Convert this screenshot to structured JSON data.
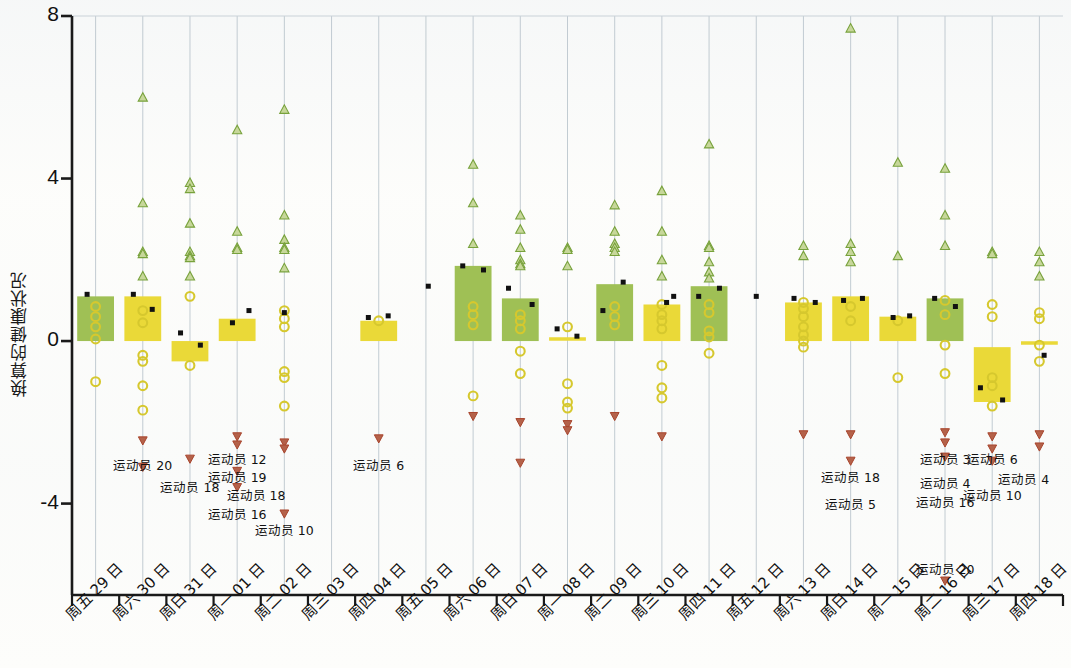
{
  "chart_data": {
    "type": "bar",
    "title": "",
    "subtitle": "",
    "xlabel": "",
    "ylabel": "换算的健康状况",
    "ylim": [
      -6.2,
      8
    ],
    "yticks": [
      8,
      4,
      0,
      -4
    ],
    "ytick_labels": [
      "8",
      "4",
      "0",
      "-4"
    ],
    "grid": true,
    "grid_orientation": "vertical",
    "legend_position": "none",
    "categories": [
      "周五 29 日",
      "周六 30 日",
      "周日 31 日",
      "周一 01 日",
      "周二 02 日",
      "周三 03 日",
      "周四 04 日",
      "周五 05 日",
      "周六 06 日",
      "周日 07 日",
      "周一 08 日",
      "周二 09 日",
      "周三 10 日",
      "周四 11 日",
      "周五 12 日",
      "周六 13 日",
      "周日 14 日",
      "周一 15 日",
      "周二 16 日",
      "周三 17 日",
      "周四 18 日"
    ],
    "bar_colors": {
      "positive_high": "#9fc055",
      "positive_low": "#ead938",
      "flat": "#ead938"
    },
    "series": [
      {
        "name": "bar",
        "description": "区间条（每日健康状况范围）",
        "values": [
          {
            "cat": "周五 29 日",
            "low": 0.0,
            "high": 1.1,
            "color": "#9fc055"
          },
          {
            "cat": "周六 30 日",
            "low": 0.0,
            "high": 1.1,
            "color": "#ead938"
          },
          {
            "cat": "周日 31 日",
            "low": -0.5,
            "high": 0.0,
            "color": "#ead938"
          },
          {
            "cat": "周一 01 日",
            "low": 0.0,
            "high": 0.55,
            "color": "#ead938"
          },
          {
            "cat": "周二 02 日",
            "low": null,
            "high": null,
            "color": "none"
          },
          {
            "cat": "周三 03 日",
            "low": null,
            "high": null,
            "color": "none"
          },
          {
            "cat": "周四 04 日",
            "low": 0.0,
            "high": 0.5,
            "color": "#ead938"
          },
          {
            "cat": "周五 05 日",
            "low": null,
            "high": null,
            "color": "none"
          },
          {
            "cat": "周六 06 日",
            "low": 0.0,
            "high": 1.85,
            "color": "#9fc055"
          },
          {
            "cat": "周日 07 日",
            "low": 0.0,
            "high": 1.05,
            "color": "#9fc055"
          },
          {
            "cat": "周一 08 日",
            "low": 0.05,
            "high": 0.05,
            "color": "#ead938"
          },
          {
            "cat": "周二 09 日",
            "low": 0.0,
            "high": 1.4,
            "color": "#9fc055"
          },
          {
            "cat": "周三 10 日",
            "low": 0.0,
            "high": 0.9,
            "color": "#ead938"
          },
          {
            "cat": "周四 11 日",
            "low": 0.0,
            "high": 1.35,
            "color": "#9fc055"
          },
          {
            "cat": "周五 12 日",
            "low": null,
            "high": null,
            "color": "none"
          },
          {
            "cat": "周六 13 日",
            "low": 0.0,
            "high": 0.95,
            "color": "#ead938"
          },
          {
            "cat": "周日 14 日",
            "low": 0.0,
            "high": 1.1,
            "color": "#ead938"
          },
          {
            "cat": "周一 15 日",
            "low": 0.0,
            "high": 0.6,
            "color": "#ead938"
          },
          {
            "cat": "周二 16 日",
            "low": 0.0,
            "high": 1.05,
            "color": "#9fc055"
          },
          {
            "cat": "周三 17 日",
            "low": -1.5,
            "high": -0.15,
            "color": "#ead938"
          },
          {
            "cat": "周四 18 日",
            "low": -0.05,
            "high": -0.05,
            "color": "#ead938"
          }
        ]
      },
      {
        "name": "mean-marker",
        "marker": "black-square",
        "points": [
          {
            "cat": "周五 29 日",
            "x_off": -0.18,
            "y": 1.15
          },
          {
            "cat": "周六 30 日",
            "x_off": -0.2,
            "y": 1.15
          },
          {
            "cat": "周六 30 日",
            "x_off": 0.2,
            "y": 0.78
          },
          {
            "cat": "周日 31 日",
            "x_off": -0.2,
            "y": 0.2
          },
          {
            "cat": "周日 31 日",
            "x_off": 0.22,
            "y": -0.1
          },
          {
            "cat": "周一 01 日",
            "x_off": -0.1,
            "y": 0.45
          },
          {
            "cat": "周一 01 日",
            "x_off": 0.25,
            "y": 0.75
          },
          {
            "cat": "周二 02 日",
            "x_off": 0.0,
            "y": 0.7
          },
          {
            "cat": "周四 04 日",
            "x_off": -0.22,
            "y": 0.58
          },
          {
            "cat": "周四 04 日",
            "x_off": 0.2,
            "y": 0.62
          },
          {
            "cat": "周五 05 日",
            "x_off": 0.05,
            "y": 1.35
          },
          {
            "cat": "周六 06 日",
            "x_off": -0.22,
            "y": 1.85
          },
          {
            "cat": "周六 06 日",
            "x_off": 0.22,
            "y": 1.75
          },
          {
            "cat": "周日 07 日",
            "x_off": -0.25,
            "y": 1.3
          },
          {
            "cat": "周日 07 日",
            "x_off": 0.25,
            "y": 0.9
          },
          {
            "cat": "周一 08 日",
            "x_off": -0.22,
            "y": 0.3
          },
          {
            "cat": "周一 08 日",
            "x_off": 0.2,
            "y": 0.12
          },
          {
            "cat": "周二 09 日",
            "x_off": -0.25,
            "y": 0.75
          },
          {
            "cat": "周二 09 日",
            "x_off": 0.18,
            "y": 1.45
          },
          {
            "cat": "周三 10 日",
            "x_off": 0.25,
            "y": 1.1
          },
          {
            "cat": "周三 10 日",
            "x_off": 0.1,
            "y": 0.95
          },
          {
            "cat": "周四 11 日",
            "x_off": -0.22,
            "y": 1.1
          },
          {
            "cat": "周四 11 日",
            "x_off": 0.22,
            "y": 1.3
          },
          {
            "cat": "周五 12 日",
            "x_off": 0.0,
            "y": 1.1
          },
          {
            "cat": "周六 13 日",
            "x_off": -0.2,
            "y": 1.05
          },
          {
            "cat": "周六 13 日",
            "x_off": 0.25,
            "y": 0.95
          },
          {
            "cat": "周日 14 日",
            "x_off": -0.15,
            "y": 1.0
          },
          {
            "cat": "周日 14 日",
            "x_off": 0.25,
            "y": 1.05
          },
          {
            "cat": "周一 15 日",
            "x_off": -0.1,
            "y": 0.58
          },
          {
            "cat": "周一 15 日",
            "x_off": 0.25,
            "y": 0.62
          },
          {
            "cat": "周二 16 日",
            "x_off": -0.22,
            "y": 1.05
          },
          {
            "cat": "周二 16 日",
            "x_off": 0.22,
            "y": 0.85
          },
          {
            "cat": "周三 17 日",
            "x_off": -0.25,
            "y": -1.15
          },
          {
            "cat": "周三 17 日",
            "x_off": 0.22,
            "y": -1.45
          },
          {
            "cat": "周四 18 日",
            "x_off": 0.1,
            "y": -0.35
          }
        ]
      },
      {
        "name": "upper-outliers",
        "marker": "green-triangle-up",
        "points": [
          {
            "cat": "周六 30 日",
            "values": [
              6.0,
              3.4,
              2.2,
              2.15,
              1.6
            ]
          },
          {
            "cat": "周日 31 日",
            "values": [
              3.9,
              3.75,
              2.9,
              2.2,
              2.1,
              2.05,
              1.6
            ]
          },
          {
            "cat": "周一 01 日",
            "values": [
              5.2,
              2.7,
              2.3,
              2.25
            ]
          },
          {
            "cat": "周二 02 日",
            "values": [
              5.7,
              3.1,
              2.5,
              2.3,
              2.25,
              1.8
            ]
          },
          {
            "cat": "周四 04 日",
            "values": []
          },
          {
            "cat": "周六 06 日",
            "values": [
              4.35,
              3.4,
              2.4
            ]
          },
          {
            "cat": "周日 07 日",
            "values": [
              3.1,
              2.75,
              2.3,
              2.0,
              1.9,
              1.85
            ]
          },
          {
            "cat": "周一 08 日",
            "values": [
              2.3,
              2.25,
              1.85
            ]
          },
          {
            "cat": "周二 09 日",
            "values": [
              3.35,
              2.7,
              2.4,
              2.3,
              2.2
            ]
          },
          {
            "cat": "周三 10 日",
            "values": [
              3.7,
              2.7,
              2.0,
              1.6
            ]
          },
          {
            "cat": "周四 11 日",
            "values": [
              4.85,
              2.35,
              2.3,
              1.95,
              1.7,
              1.55
            ]
          },
          {
            "cat": "周六 13 日",
            "values": [
              2.35,
              2.1
            ]
          },
          {
            "cat": "周日 14 日",
            "values": [
              7.7,
              2.4,
              2.2,
              1.95
            ]
          },
          {
            "cat": "周一 15 日",
            "values": [
              4.4,
              2.1
            ]
          },
          {
            "cat": "周二 16 日",
            "values": [
              4.25,
              3.1,
              2.35
            ]
          },
          {
            "cat": "周三 17 日",
            "values": [
              2.2,
              2.15
            ]
          },
          {
            "cat": "周四 18 日",
            "values": [
              2.2,
              1.95,
              1.6
            ]
          }
        ]
      },
      {
        "name": "mid-values",
        "marker": "yellow-circle",
        "points": [
          {
            "cat": "周五 29 日",
            "values": [
              0.85,
              0.6,
              0.35,
              0.05,
              -1.0
            ]
          },
          {
            "cat": "周六 30 日",
            "values": [
              0.75,
              0.45,
              -0.35,
              -0.5,
              -1.1,
              -1.7
            ]
          },
          {
            "cat": "周日 31 日",
            "values": [
              1.1,
              -0.6
            ]
          },
          {
            "cat": "周二 02 日",
            "values": [
              0.75,
              0.55,
              0.35,
              -0.75,
              -0.9,
              -1.6
            ]
          },
          {
            "cat": "周四 04 日",
            "values": [
              0.5
            ]
          },
          {
            "cat": "周六 06 日",
            "values": [
              0.85,
              0.65,
              0.4,
              -1.35
            ]
          },
          {
            "cat": "周日 07 日",
            "values": [
              0.65,
              0.5,
              0.3,
              -0.25,
              -0.8
            ]
          },
          {
            "cat": "周一 08 日",
            "values": [
              0.35,
              -1.05,
              -1.5,
              -1.65
            ]
          },
          {
            "cat": "周二 09 日",
            "values": [
              0.85,
              0.6,
              0.4
            ]
          },
          {
            "cat": "周三 10 日",
            "values": [
              0.9,
              0.65,
              0.5,
              0.3,
              -0.6,
              -1.15,
              -1.4
            ]
          },
          {
            "cat": "周四 11 日",
            "values": [
              0.9,
              0.7,
              0.25,
              0.1,
              -0.3
            ]
          },
          {
            "cat": "周六 13 日",
            "values": [
              0.95,
              0.8,
              0.6,
              0.35,
              0.15,
              0.0,
              -0.15
            ]
          },
          {
            "cat": "周日 14 日",
            "values": [
              0.85,
              0.5
            ]
          },
          {
            "cat": "周一 15 日",
            "values": [
              0.5,
              -0.9
            ]
          },
          {
            "cat": "周二 16 日",
            "values": [
              1.0,
              0.65,
              -0.1,
              -0.8
            ]
          },
          {
            "cat": "周三 17 日",
            "values": [
              0.9,
              0.6,
              -0.9,
              -1.1,
              -1.6
            ]
          },
          {
            "cat": "周四 18 日",
            "values": [
              0.7,
              0.55,
              -0.1,
              -0.5
            ]
          }
        ]
      },
      {
        "name": "lower-outliers",
        "marker": "red-triangle-down",
        "points": [
          {
            "cat": "周六 30 日",
            "values": [
              -2.45,
              -3.1
            ]
          },
          {
            "cat": "周日 31 日",
            "values": [
              -2.9
            ]
          },
          {
            "cat": "周一 01 日",
            "values": [
              -2.35,
              -2.55,
              -3.2,
              -3.6
            ]
          },
          {
            "cat": "周二 02 日",
            "values": [
              -2.5,
              -2.65,
              -4.25
            ]
          },
          {
            "cat": "周四 04 日",
            "values": [
              -2.4
            ]
          },
          {
            "cat": "周六 06 日",
            "values": [
              -1.85
            ]
          },
          {
            "cat": "周日 07 日",
            "values": [
              -2.0,
              -3.0
            ]
          },
          {
            "cat": "周一 08 日",
            "values": [
              -2.05,
              -2.2
            ]
          },
          {
            "cat": "周二 09 日",
            "values": [
              -1.85
            ]
          },
          {
            "cat": "周三 10 日",
            "values": [
              -2.35
            ]
          },
          {
            "cat": "周六 13 日",
            "values": [
              -2.3
            ]
          },
          {
            "cat": "周日 14 日",
            "values": [
              -2.3,
              -2.95
            ]
          },
          {
            "cat": "周二 16 日",
            "values": [
              -2.25,
              -2.5,
              -2.85,
              -5.9
            ]
          },
          {
            "cat": "周三 17 日",
            "values": [
              -2.35,
              -2.65,
              -2.95
            ]
          },
          {
            "cat": "周四 18 日",
            "values": [
              -2.3,
              -2.6
            ]
          }
        ]
      }
    ],
    "annotations": [
      {
        "text": "运动员 20",
        "cat": "周六 30 日",
        "y": -3.0,
        "align": "center"
      },
      {
        "text": "运动员 18",
        "cat": "周日 31 日",
        "y": -3.55,
        "align": "center"
      },
      {
        "text": "运动员 12",
        "cat": "周一 01 日",
        "y": -2.85,
        "align": "center"
      },
      {
        "text": "运动员 19",
        "cat": "周一 01 日",
        "y": -3.3,
        "align": "center"
      },
      {
        "text": "运动员 18",
        "cat": "周一 01 日",
        "y": -3.75,
        "align": "right"
      },
      {
        "text": "运动员 16",
        "cat": "周一 01 日",
        "y": -4.2,
        "align": "center"
      },
      {
        "text": "运动员 10",
        "cat": "周二 02 日",
        "y": -4.6,
        "align": "center"
      },
      {
        "text": "运动员 6",
        "cat": "周四 04 日",
        "y": -3.0,
        "align": "center"
      },
      {
        "text": "运动员 18",
        "cat": "周日 14 日",
        "y": -3.3,
        "align": "center"
      },
      {
        "text": "运动员 5",
        "cat": "周日 14 日",
        "y": -3.95,
        "align": "center"
      },
      {
        "text": "运动员 3",
        "cat": "周二 16 日",
        "y": -2.85,
        "align": "center"
      },
      {
        "text": "运动员 4",
        "cat": "周二 16 日",
        "y": -3.45,
        "align": "center"
      },
      {
        "text": "运动员 16",
        "cat": "周二 16 日",
        "y": -3.9,
        "align": "center"
      },
      {
        "text": "运动员 20",
        "cat": "周二 16 日",
        "y": -5.55,
        "align": "center"
      },
      {
        "text": "运动员 6",
        "cat": "周三 17 日",
        "y": -2.85,
        "align": "center"
      },
      {
        "text": "运动员 4",
        "cat": "周三 17 日",
        "y": -3.35,
        "align": "right-edge"
      },
      {
        "text": "运动员 10",
        "cat": "周三 17 日",
        "y": -3.75,
        "align": "center"
      }
    ]
  },
  "axes": {
    "y_title": "换算的健康状况",
    "y_tick_labels": [
      "8",
      "4",
      "0",
      "-4"
    ],
    "x_tick_labels": [
      "周五 29 日",
      "周六 30 日",
      "周日 31 日",
      "周一 01 日",
      "周二 02 日",
      "周三 03 日",
      "周四 04 日",
      "周五 05 日",
      "周六 06 日",
      "周日 07 日",
      "周一 08 日",
      "周二 09 日",
      "周三 10 日",
      "周四 11 日",
      "周五 12 日",
      "周六 13 日",
      "周日 14 日",
      "周一 15 日",
      "周二 16 日",
      "周三 17 日",
      "周四 18 日"
    ]
  },
  "colors": {
    "green_bar": "#9fc055",
    "yellow_bar": "#ead938",
    "marker_black": "#111111",
    "marker_green": "#78a23c",
    "marker_yellow": "#d6c82e",
    "marker_red": "#a8442c",
    "grid": "#b9c4cc",
    "axis": "#1a1a1a",
    "background": "#fdfdfb"
  }
}
